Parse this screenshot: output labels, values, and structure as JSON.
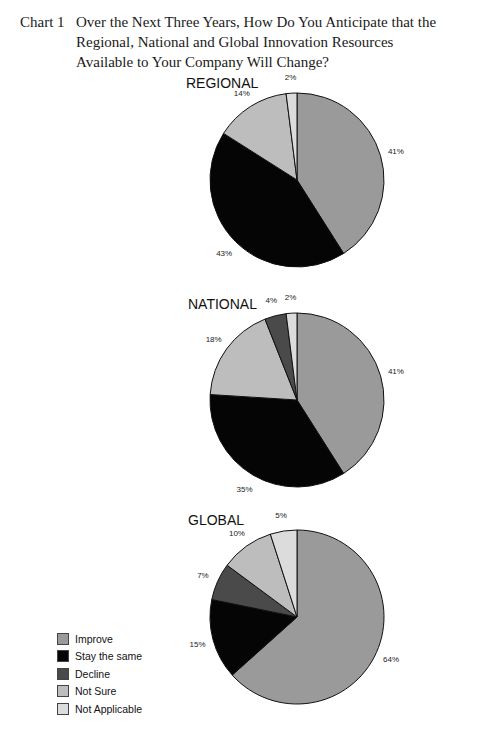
{
  "caption": {
    "number": "Chart 1",
    "text": "Over the Next Three Years, How Do You Anticipate that the Regional, National and Global Innovation Resources Available to Your Company Will Change?"
  },
  "colors": {
    "Improve": "#9a9a9a",
    "Stay the same": "#050505",
    "Decline": "#4a4a4a",
    "Not Sure": "#bdbdbd",
    "Not Applicable": "#dcdcdc"
  },
  "legend": [
    {
      "label": "Improve",
      "color": "#9a9a9a"
    },
    {
      "label": "Stay the same",
      "color": "#050505"
    },
    {
      "label": "Decline",
      "color": "#4a4a4a"
    },
    {
      "label": "Not Sure",
      "color": "#bdbdbd"
    },
    {
      "label": "Not Applicable",
      "color": "#dcdcdc"
    }
  ],
  "chart_data": [
    {
      "type": "pie",
      "title": "REGIONAL",
      "categories": [
        "Improve",
        "Stay the same",
        "Not Sure",
        "Not Applicable"
      ],
      "values": [
        41,
        43,
        14,
        2
      ],
      "labels": [
        "41%",
        "43%",
        "14%",
        "2%"
      ]
    },
    {
      "type": "pie",
      "title": "NATIONAL",
      "categories": [
        "Improve",
        "Stay the same",
        "Not Sure",
        "Decline",
        "Not Applicable"
      ],
      "values": [
        41,
        35,
        18,
        4,
        2
      ],
      "labels": [
        "41%",
        "35%",
        "18%",
        "4%",
        "2%"
      ]
    },
    {
      "type": "pie",
      "title": "GLOBAL",
      "categories": [
        "Improve",
        "Stay the same",
        "Decline",
        "Not Sure",
        "Not Applicable"
      ],
      "values": [
        64,
        15,
        7,
        10,
        5
      ],
      "labels": [
        "64%",
        "15%",
        "7%",
        "10%",
        "5%"
      ]
    }
  ],
  "pies_layout": [
    {
      "cx": 297,
      "cy": 180,
      "r": 87,
      "title_x": 186,
      "title_y": 75
    },
    {
      "cx": 297,
      "cy": 400,
      "r": 87,
      "title_x": 188,
      "title_y": 296
    },
    {
      "cx": 297,
      "cy": 617,
      "r": 87,
      "title_x": 188,
      "title_y": 512
    }
  ]
}
